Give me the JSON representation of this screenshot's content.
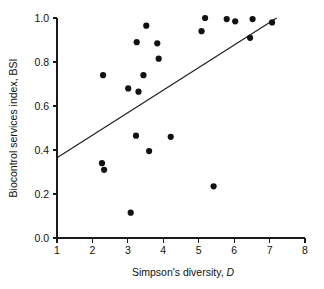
{
  "chart_data": {
    "type": "scatter",
    "title": "",
    "xlabel": "Simpson's diversity, D",
    "xlabel_plain": "Simpson's diversity,",
    "xlabel_symbol": "D",
    "ylabel": "Biocontrol services index, BSI",
    "xlim": [
      1,
      8
    ],
    "ylim": [
      0.0,
      1.0
    ],
    "xticks": [
      1,
      2,
      3,
      4,
      5,
      6,
      7,
      8
    ],
    "xticklabels": [
      "1",
      "2",
      "3",
      "4",
      "5",
      "6",
      "7",
      "8"
    ],
    "yticks": [
      0.0,
      0.2,
      0.4,
      0.6,
      0.8,
      1.0
    ],
    "yticklabels": [
      "0.0",
      "0.2",
      "0.4",
      "0.6",
      "0.8",
      "1.0"
    ],
    "grid": false,
    "legend": null,
    "marker": "filled-circle",
    "marker_color": "#111111",
    "marker_size_px": 3.1,
    "points": [
      {
        "x": 2.27,
        "y": 0.34
      },
      {
        "x": 2.3,
        "y": 0.74
      },
      {
        "x": 2.33,
        "y": 0.31
      },
      {
        "x": 3.01,
        "y": 0.68
      },
      {
        "x": 3.08,
        "y": 0.115
      },
      {
        "x": 3.23,
        "y": 0.465
      },
      {
        "x": 3.25,
        "y": 0.89
      },
      {
        "x": 3.3,
        "y": 0.665
      },
      {
        "x": 3.44,
        "y": 0.74
      },
      {
        "x": 3.52,
        "y": 0.965
      },
      {
        "x": 3.6,
        "y": 0.395
      },
      {
        "x": 3.83,
        "y": 0.885
      },
      {
        "x": 3.87,
        "y": 0.815
      },
      {
        "x": 4.21,
        "y": 0.46
      },
      {
        "x": 5.08,
        "y": 0.94
      },
      {
        "x": 5.18,
        "y": 1.0
      },
      {
        "x": 5.42,
        "y": 0.235
      },
      {
        "x": 5.79,
        "y": 0.995
      },
      {
        "x": 6.03,
        "y": 0.985
      },
      {
        "x": 6.45,
        "y": 0.91
      },
      {
        "x": 6.52,
        "y": 0.995
      },
      {
        "x": 7.07,
        "y": 0.98
      }
    ],
    "fit_line": {
      "type": "linear-regression",
      "x_start": 1.0,
      "y_start": 0.365,
      "x_end": 7.2,
      "y_end": 1.0,
      "color": "#1a1a1a"
    }
  }
}
